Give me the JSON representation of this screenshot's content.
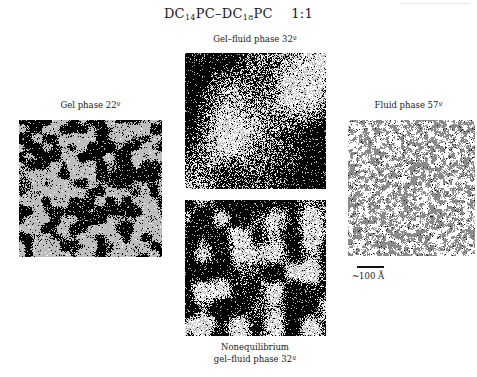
{
  "figure": {
    "title": {
      "lipid_a": "DC",
      "lipid_a_sub": "14",
      "lipid_a_suffix": "PC",
      "separator": "–",
      "lipid_b": "DC",
      "lipid_b_sub": "18",
      "lipid_b_suffix": "PC",
      "ratio": "1:1"
    },
    "panels": [
      {
        "id": "gel",
        "label": "Gel phase 22º",
        "label_lines": [
          "Gel phase 22º"
        ],
        "box": {
          "x": 19,
          "y": 120,
          "w": 143,
          "h": 137
        },
        "label_pos": {
          "x": 19,
          "y": 100,
          "w": 143
        },
        "pattern": {
          "seed": 11,
          "blob_scale": 9,
          "threshold": 0.48,
          "colors": {
            "a": "#000000",
            "b": "#bdbdbd",
            "c": "#ffffff"
          },
          "noise": 0.12,
          "mix_c": 0.04,
          "stripe": 0.25
        }
      },
      {
        "id": "gel-fluid",
        "label": "Gel–fluid phase 32º",
        "label_lines": [
          "Gel–fluid phase 32º"
        ],
        "box": {
          "x": 185,
          "y": 53,
          "w": 141,
          "h": 136
        },
        "label_pos": {
          "x": 170,
          "y": 34,
          "w": 170
        },
        "pattern": {
          "seed": 23,
          "blob_scale": 40,
          "threshold": 0.5,
          "colors": {
            "a": "#000000",
            "b": "#bdbdbd",
            "c": "#ffffff"
          },
          "noise": 0.22,
          "mix_c": 0.55,
          "diagonal": true
        }
      },
      {
        "id": "nonequilibrium",
        "label": "Nonequilibrium gel–fluid phase 32º",
        "label_lines": [
          "Nonequilibrium",
          "gel–fluid phase 32º"
        ],
        "box": {
          "x": 185,
          "y": 200,
          "w": 141,
          "h": 136
        },
        "label_pos": {
          "x": 170,
          "y": 341,
          "w": 170
        },
        "pattern": {
          "seed": 37,
          "blob_scale": 18,
          "threshold": 0.52,
          "colors": {
            "a": "#000000",
            "b": "#bdbdbd",
            "c": "#ffffff"
          },
          "noise": 0.2,
          "mix_c": 0.55
        }
      },
      {
        "id": "fluid",
        "label": "Fluid phase 57º",
        "label_lines": [
          "Fluid phase 57º"
        ],
        "box": {
          "x": 348,
          "y": 120,
          "w": 127,
          "h": 136
        },
        "label_pos": {
          "x": 340,
          "y": 100,
          "w": 137
        },
        "pattern": {
          "seed": 51,
          "blob_scale": 3,
          "threshold": 0.5,
          "colors": {
            "a": "#8a8a8a",
            "b": "#ffffff",
            "c": "#111111"
          },
          "noise": 0.3,
          "mix_c": 0.03,
          "fluid": true
        }
      }
    ],
    "scale_bar": {
      "label": "~100 Å",
      "line": {
        "x": 357,
        "y": 266,
        "w": 27
      },
      "label_pos": {
        "x": 352,
        "y": 271
      }
    }
  }
}
